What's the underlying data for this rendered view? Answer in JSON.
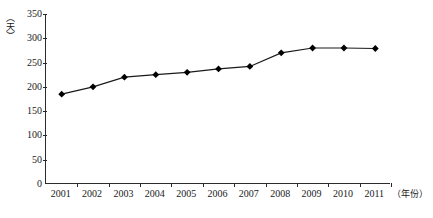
{
  "chart_data": {
    "type": "line",
    "title": "",
    "subtitle": "",
    "xlabel": "（年份）",
    "ylabel": "（天）",
    "categories": [
      "2001",
      "2002",
      "2003",
      "2004",
      "2005",
      "2006",
      "2007",
      "2008",
      "2009",
      "2010",
      "2011"
    ],
    "values": [
      185,
      200,
      220,
      225,
      230,
      237,
      242,
      270,
      280,
      280,
      279
    ],
    "series": [
      {
        "name": "",
        "values": [
          185,
          200,
          220,
          225,
          230,
          237,
          242,
          270,
          280,
          280,
          279
        ]
      }
    ],
    "ylim": [
      0,
      350
    ],
    "yticks": [
      0,
      50,
      100,
      150,
      200,
      250,
      300,
      350
    ],
    "ytick_labels": [
      "0",
      "50",
      "100",
      "150",
      "200",
      "250",
      "300",
      "350"
    ],
    "grid": false,
    "legend": "none",
    "marker": "diamond",
    "line_color": "#1a1a1a",
    "marker_color": "#000000",
    "axis_color": "#2b2b2b",
    "background_color": "#ffffff"
  }
}
